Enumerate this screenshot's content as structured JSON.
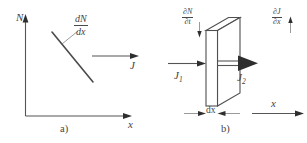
{
  "figure": {
    "background_color": "#ffffff",
    "line_color": "#4a4a4a",
    "panel_a": {
      "caption": "a)",
      "y_axis_label": "N",
      "x_axis_label": "x",
      "gradient_label": {
        "numerator": "dN",
        "denominator": "dx"
      },
      "flux_label": "J"
    },
    "panel_b": {
      "caption": "b)",
      "x_axis_label": "x",
      "thickness_label": "dx",
      "rate_label": {
        "numerator": "∂N",
        "denominator": "∂t"
      },
      "divergence_label": {
        "numerator": "∂J",
        "denominator": "∂x"
      },
      "flux_in_label": "J",
      "flux_in_subscript": "1",
      "flux_out_label": "J",
      "flux_out_subscript": "2"
    }
  }
}
